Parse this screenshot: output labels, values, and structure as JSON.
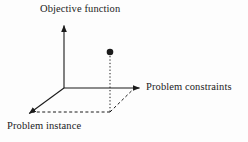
{
  "figure": {
    "kind": "3d-axis-diagram",
    "background_color": "#fdfdfd",
    "ink_color": "#1b1b1b",
    "labels": {
      "vertical_axis": "Objective function",
      "horizontal_axis": "Problem constraints",
      "depth_axis": "Problem instance"
    },
    "axes": [
      {
        "name": "objective-function-axis",
        "label": "Objective function",
        "from": [
          64,
          88
        ],
        "to": [
          64,
          22
        ],
        "arrow": true,
        "style": "solid"
      },
      {
        "name": "problem-constraints-axis",
        "label": "Problem constraints",
        "from": [
          64,
          88
        ],
        "to": [
          143,
          88
        ],
        "arrow": true,
        "style": "solid"
      },
      {
        "name": "problem-instance-axis",
        "label": "Problem instance",
        "from": [
          64,
          88
        ],
        "to": [
          26,
          116
        ],
        "arrow": true,
        "style": "solid"
      }
    ],
    "data_point": {
      "name": "solution-point",
      "center": [
        110,
        52
      ],
      "radius": 3.2,
      "fill": "#1b1b1b"
    },
    "projection_lines": [
      {
        "name": "vertical-drop-line",
        "from": [
          110,
          55
        ],
        "to": [
          110,
          112
        ],
        "style": "dotted"
      },
      {
        "name": "depth-projection-line",
        "from": [
          110,
          112
        ],
        "to": [
          33,
          112
        ],
        "style": "dashed"
      },
      {
        "name": "constraint-projection-line",
        "from": [
          110,
          112
        ],
        "to": [
          133,
          90
        ],
        "style": "dashed"
      }
    ]
  }
}
